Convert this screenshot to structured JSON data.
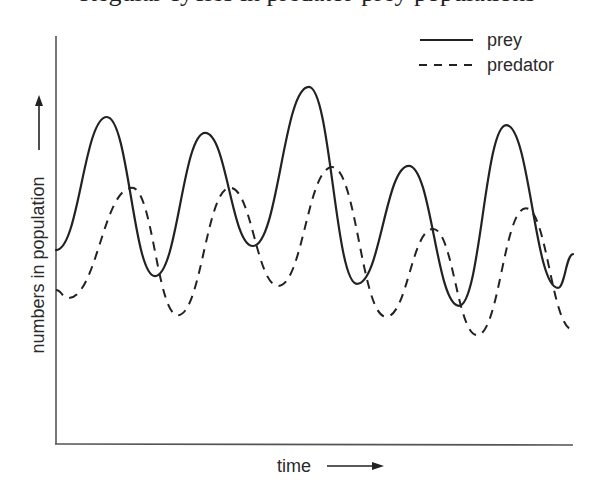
{
  "title": "Regular cycles in predator-prey populations",
  "chart_data": {
    "type": "line",
    "title": "",
    "xlabel": "time",
    "ylabel": "numbers in population",
    "xlim": [
      0,
      10
    ],
    "ylim": [
      0,
      100
    ],
    "grid": false,
    "ticks": false,
    "legend_position": "top-right",
    "series": [
      {
        "name": "prey",
        "style": "solid",
        "x": [
          0.02,
          1.0,
          1.93,
          2.9,
          3.82,
          4.9,
          5.83,
          6.83,
          7.8,
          8.71,
          9.71,
          10.0
        ],
        "values": [
          47.4,
          80.1,
          41.0,
          76.2,
          48.4,
          87.5,
          39.1,
          68.1,
          33.7,
          78.1,
          38.1,
          46.4
        ]
      },
      {
        "name": "predator",
        "style": "dashed",
        "x": [
          0.02,
          0.25,
          1.49,
          2.37,
          3.38,
          4.31,
          5.35,
          6.39,
          7.3,
          8.15,
          9.09,
          10.0
        ],
        "values": [
          37.6,
          35.6,
          62.7,
          31.4,
          62.7,
          38.6,
          67.8,
          31.0,
          52.6,
          26.5,
          57.7,
          27.8
        ]
      }
    ]
  },
  "legend": {
    "prey_label": "prey",
    "predator_label": "predator"
  },
  "axes": {
    "x_label": "time",
    "y_label": "numbers in population"
  }
}
